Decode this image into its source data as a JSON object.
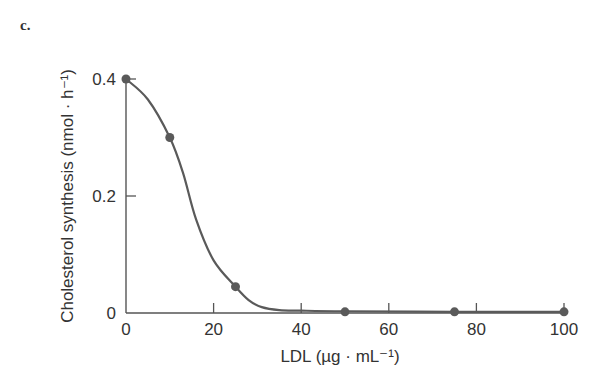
{
  "panel_label": "c.",
  "chart_data": {
    "type": "line",
    "title": "",
    "xlabel": "LDL (µg · mL⁻¹)",
    "ylabel": "Cholesterol synthesis (nmol · h⁻¹)",
    "x": [
      0,
      10,
      25,
      50,
      75,
      100
    ],
    "values": [
      0.4,
      0.3,
      0.045,
      0.002,
      0.002,
      0.002
    ],
    "xlim": [
      0,
      100
    ],
    "ylim": [
      0,
      0.4
    ],
    "xticks": [
      "0",
      "20",
      "40",
      "60",
      "80",
      "100"
    ],
    "yticks": [
      "0",
      "0.2",
      "0.4"
    ],
    "grid": false,
    "legend": null,
    "line_color": "#5a5a5a",
    "marker_color": "#5a5a5a"
  }
}
